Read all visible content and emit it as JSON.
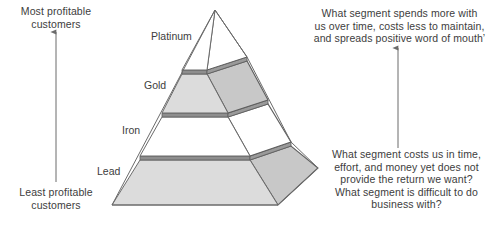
{
  "diagram": {
    "axis_left": {
      "top_label": "Most profitable\ncustomers",
      "bottom_label": "Least profitable\ncustomers",
      "arrow_direction": "up"
    },
    "pyramid": {
      "tiers": [
        {
          "name": "Platinum",
          "rank": 1,
          "fill": "#ffffff"
        },
        {
          "name": "Gold",
          "rank": 2,
          "fill": "#d9d9d9"
        },
        {
          "name": "Iron",
          "rank": 3,
          "fill": "#ffffff"
        },
        {
          "name": "Lead",
          "rank": 4,
          "fill": "#d9d9d9"
        }
      ],
      "side_fill": "#c8c8c8",
      "edge_color": "#6b6b6b",
      "band_color": "#8c8c8c"
    },
    "annotations": {
      "top_right": "What segment spends more with\nus over time, costs less to maintain,\nand spreads positive word of mouth’",
      "bottom_right": "What segment costs us in time,\neffort, and money yet does not\nprovide the return we want?\nWhat segment is difficult to do\nbusiness with?",
      "right_arrow_direction": "up"
    },
    "colors": {
      "text": "#3d3d3d",
      "line": "#6b6b6b",
      "shade": "#d9d9d9",
      "shade_dark": "#c8c8c8",
      "background": "#ffffff"
    }
  }
}
